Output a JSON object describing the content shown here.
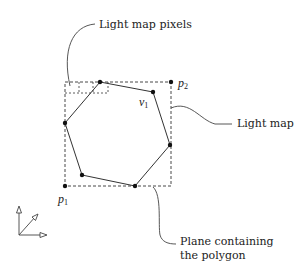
{
  "diagram": {
    "type": "light-map-polygon",
    "labels": {
      "light_map_pixels": "Light map pixels",
      "light_map": "Light map",
      "plane_line1": "Plane containing",
      "plane_line2": "the polygon"
    },
    "points": {
      "p1": {
        "name": "p",
        "sub": "1"
      },
      "p2": {
        "name": "p",
        "sub": "2"
      },
      "v1": {
        "name": "v",
        "sub": "1"
      }
    },
    "polygon_vertices": [
      [
        100,
        82
      ],
      [
        153,
        92
      ],
      [
        170,
        145
      ],
      [
        135,
        186
      ],
      [
        82,
        175
      ],
      [
        65,
        123
      ]
    ],
    "light_map_rect": {
      "x1": 65,
      "y1": 82,
      "x2": 171,
      "y2": 186
    },
    "colors": {
      "stroke": "#222222",
      "background": "#ffffff"
    }
  }
}
